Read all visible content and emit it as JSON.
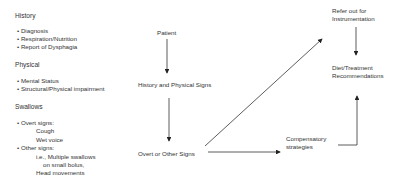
{
  "left_panel": {
    "history": {
      "heading": "History",
      "items": [
        "Diagnosis",
        "Respiration/Nutrition",
        "Report of Dysphagia"
      ]
    },
    "physical": {
      "heading": "Physical",
      "items": [
        "Mental Status",
        "Structural/Physical impairment"
      ]
    },
    "swallows": {
      "heading": "Swallows",
      "overt_label": "Overt signs:",
      "overt_items": [
        "Cough",
        "Wet voice"
      ],
      "other_label": "Other signs:",
      "other_items": [
        "i.e., Multiple swallows",
        "on small bolus,",
        "Head movements"
      ]
    }
  },
  "flow": {
    "patient": "Patient",
    "history_physical": "History and Physical Signs",
    "overt_other": "Overt or Other Signs",
    "refer_line1": "Refer out for",
    "refer_line2": "Instrumentation",
    "diet_line1": "Diet/Treatment",
    "diet_line2": "Recommendations",
    "comp_line1": "Compensatory",
    "comp_line2": "strategies"
  },
  "bullet": "•"
}
